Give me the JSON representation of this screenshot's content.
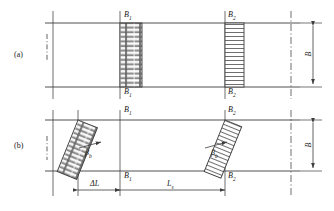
{
  "figure": {
    "type": "engineering-diagram",
    "panels": [
      {
        "id": "a",
        "label": "(a)"
      },
      {
        "id": "b",
        "label": "(b)"
      }
    ],
    "labels": {
      "b1": "B",
      "b1_sub": "1",
      "b2": "B",
      "b2_sub": "2",
      "beta": "β",
      "beta_sub": "b",
      "height": "B",
      "delta_l": "ΔL",
      "length_l": "L",
      "length_l_sub": "s"
    },
    "annotations": {
      "panel_a_left_band": "comb-hatched vertical band at B1",
      "panel_a_right_band": "horizontally hatched vertical band at B2",
      "panel_b_left_band": "comb-hatched inclined band at B1",
      "panel_b_right_band": "horizontally hatched inclined band at B2",
      "angle_marks": "beta_b measured from vertical reference line"
    },
    "dimensions": {
      "delta_l_label": "ΔL",
      "l_label": "L",
      "height_label": "B"
    },
    "colors": {
      "line": "#3d3d3d",
      "hatch": "#4a4a4a",
      "text": "#1a1a1a",
      "background": "#ffffff"
    }
  }
}
